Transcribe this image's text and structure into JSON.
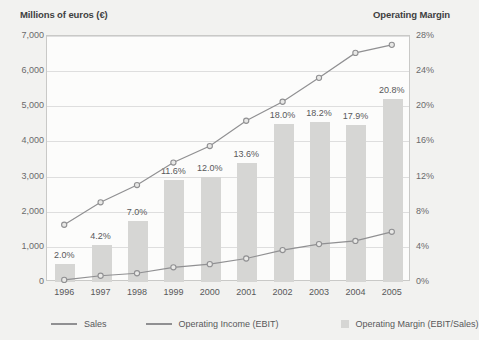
{
  "left_axis_title": "Millions of euros (€)",
  "right_axis_title": "Operating Margin",
  "legend": {
    "sales_label": "Sales",
    "ebit_label": "Operating Income (EBIT)",
    "margin_label": "Operating Margin (EBIT/Sales)",
    "line_color": "#909092",
    "bar_color": "#d6d6d4"
  },
  "chart_data": {
    "type": "bar",
    "title": "",
    "subtitle": "",
    "xlabel": "",
    "ylabel": "Millions of euros (€)",
    "y2label": "Operating Margin",
    "grid": true,
    "legend_position": "bottom",
    "categories": [
      "1996",
      "1997",
      "1998",
      "1999",
      "2000",
      "2001",
      "2002",
      "2003",
      "2004",
      "2005"
    ],
    "ylim": [
      0,
      7000
    ],
    "yticks": [
      "0",
      "1,000",
      "2,000",
      "3,000",
      "4,000",
      "5,000",
      "6,000",
      "7,000"
    ],
    "ytick_values": [
      0,
      1000,
      2000,
      3000,
      4000,
      5000,
      6000,
      7000
    ],
    "y2lim": [
      0,
      28
    ],
    "y2ticks": [
      "0%",
      "4%",
      "8%",
      "12%",
      "16%",
      "20%",
      "24%",
      "28%"
    ],
    "y2tick_values": [
      0,
      4,
      8,
      12,
      16,
      20,
      24,
      28
    ],
    "series": [
      {
        "name": "Operating Margin (EBIT/Sales)",
        "type": "bar",
        "axis": "right",
        "unit": "%",
        "values": [
          2.0,
          4.2,
          7.0,
          11.6,
          12.0,
          13.6,
          18.0,
          18.2,
          17.9,
          20.8
        ],
        "labels": [
          "2.0%",
          "4.2%",
          "7.0%",
          "11.6%",
          "12.0%",
          "13.6%",
          "18.0%",
          "18.2%",
          "17.9%",
          "20.8%"
        ],
        "color": "#d6d6d4"
      },
      {
        "name": "Sales",
        "type": "line",
        "axis": "left",
        "values": [
          1600,
          2240,
          2730,
          3370,
          3840,
          4560,
          5100,
          5780,
          6490,
          6720
        ],
        "color": "#909092"
      },
      {
        "name": "Operating Income (EBIT)",
        "type": "line",
        "axis": "left",
        "values": [
          32,
          150,
          220,
          390,
          480,
          640,
          880,
          1050,
          1140,
          1400
        ],
        "color": "#909092"
      }
    ]
  }
}
